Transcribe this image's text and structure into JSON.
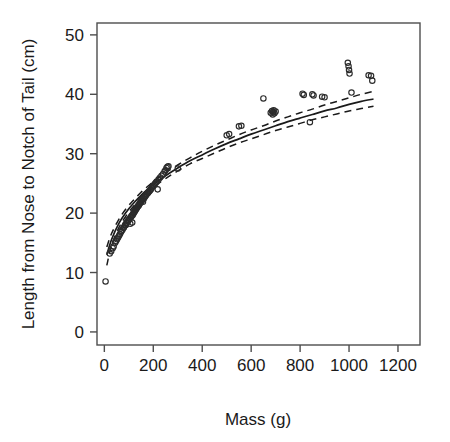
{
  "chart_data": {
    "type": "scatter",
    "title": "",
    "xlabel": "Mass (g)",
    "ylabel": "Length from Nose to Notch of Tail (cm)",
    "xlim": [
      -30,
      1290
    ],
    "ylim": [
      -2.2,
      52
    ],
    "xticks": [
      0,
      200,
      400,
      600,
      800,
      1000,
      1200
    ],
    "yticks": [
      0,
      10,
      20,
      30,
      40,
      50
    ],
    "xtick_labels": [
      "0",
      "200",
      "400",
      "600",
      "800",
      "1000",
      "1200"
    ],
    "ytick_labels": [
      "0",
      "10",
      "20",
      "30",
      "40",
      "50"
    ],
    "grid": false,
    "legend": false,
    "box_frame": true,
    "point_marker": "open-circle",
    "point_color": "#2b2b2b",
    "line_color": "#1a1a1a",
    "background_color": "#ffffff",
    "series": [
      {
        "name": "observations",
        "type": "scatter",
        "points": [
          [
            5,
            8.5
          ],
          [
            22,
            13.2
          ],
          [
            28,
            13.6
          ],
          [
            34,
            14.1
          ],
          [
            38,
            14.4
          ],
          [
            44,
            15.0
          ],
          [
            48,
            15.3
          ],
          [
            52,
            15.6
          ],
          [
            56,
            15.9
          ],
          [
            60,
            16.2
          ],
          [
            64,
            16.5
          ],
          [
            68,
            16.8
          ],
          [
            70,
            17.0
          ],
          [
            74,
            17.2
          ],
          [
            78,
            17.5
          ],
          [
            80,
            17.6
          ],
          [
            84,
            17.9
          ],
          [
            86,
            18.1
          ],
          [
            88,
            18.0
          ],
          [
            90,
            18.3
          ],
          [
            92,
            18.4
          ],
          [
            96,
            18.6
          ],
          [
            98,
            18.8
          ],
          [
            100,
            18.9
          ],
          [
            104,
            19.1
          ],
          [
            106,
            18.2
          ],
          [
            108,
            19.3
          ],
          [
            110,
            19.4
          ],
          [
            112,
            19.6
          ],
          [
            114,
            18.4
          ],
          [
            116,
            19.7
          ],
          [
            118,
            19.9
          ],
          [
            120,
            20.0
          ],
          [
            122,
            20.2
          ],
          [
            124,
            20.3
          ],
          [
            126,
            20.4
          ],
          [
            128,
            20.6
          ],
          [
            130,
            20.7
          ],
          [
            132,
            20.8
          ],
          [
            134,
            21.0
          ],
          [
            136,
            21.1
          ],
          [
            138,
            21.2
          ],
          [
            140,
            21.3
          ],
          [
            142,
            21.4
          ],
          [
            144,
            21.6
          ],
          [
            146,
            21.7
          ],
          [
            148,
            21.8
          ],
          [
            150,
            22.0
          ],
          [
            152,
            22.1
          ],
          [
            154,
            22.2
          ],
          [
            156,
            22.3
          ],
          [
            158,
            21.9
          ],
          [
            160,
            22.4
          ],
          [
            162,
            22.5
          ],
          [
            165,
            22.7
          ],
          [
            168,
            22.9
          ],
          [
            170,
            23.0
          ],
          [
            174,
            23.2
          ],
          [
            178,
            23.4
          ],
          [
            180,
            23.5
          ],
          [
            184,
            23.7
          ],
          [
            188,
            23.9
          ],
          [
            190,
            24.0
          ],
          [
            194,
            24.3
          ],
          [
            198,
            24.5
          ],
          [
            202,
            24.7
          ],
          [
            206,
            24.9
          ],
          [
            210,
            25.1
          ],
          [
            214,
            25.3
          ],
          [
            218,
            24.0
          ],
          [
            222,
            25.7
          ],
          [
            228,
            26.0
          ],
          [
            234,
            26.3
          ],
          [
            240,
            26.6
          ],
          [
            246,
            27.0
          ],
          [
            250,
            27.2
          ],
          [
            254,
            27.6
          ],
          [
            258,
            27.8
          ],
          [
            262,
            27.9
          ],
          [
            300,
            27.5
          ],
          [
            500,
            33.1
          ],
          [
            510,
            33.3
          ],
          [
            550,
            34.6
          ],
          [
            560,
            34.7
          ],
          [
            650,
            39.3
          ],
          [
            680,
            36.9
          ],
          [
            685,
            37.2
          ],
          [
            688,
            36.6
          ],
          [
            690,
            37.0
          ],
          [
            692,
            37.3
          ],
          [
            695,
            36.8
          ],
          [
            700,
            37.1
          ],
          [
            810,
            40.1
          ],
          [
            815,
            39.9
          ],
          [
            840,
            35.3
          ],
          [
            850,
            40.0
          ],
          [
            855,
            39.8
          ],
          [
            890,
            39.6
          ],
          [
            900,
            39.5
          ],
          [
            995,
            45.3
          ],
          [
            998,
            44.7
          ],
          [
            1000,
            44.1
          ],
          [
            1002,
            43.5
          ],
          [
            1010,
            40.3
          ],
          [
            1080,
            43.2
          ],
          [
            1090,
            43.1
          ],
          [
            1095,
            42.3
          ]
        ]
      },
      {
        "name": "fitted-curve",
        "type": "line",
        "style": "solid",
        "points": [
          [
            10,
            13.0
          ],
          [
            30,
            15.6
          ],
          [
            60,
            18.3
          ],
          [
            90,
            20.2
          ],
          [
            120,
            21.7
          ],
          [
            150,
            23.0
          ],
          [
            180,
            24.1
          ],
          [
            210,
            25.1
          ],
          [
            250,
            26.3
          ],
          [
            300,
            27.6
          ],
          [
            350,
            28.8
          ],
          [
            400,
            29.8
          ],
          [
            450,
            30.8
          ],
          [
            500,
            31.7
          ],
          [
            550,
            32.5
          ],
          [
            600,
            33.3
          ],
          [
            650,
            34.0
          ],
          [
            700,
            34.7
          ],
          [
            750,
            35.4
          ],
          [
            800,
            36.0
          ],
          [
            850,
            36.6
          ],
          [
            900,
            37.2
          ],
          [
            950,
            37.7
          ],
          [
            1000,
            38.3
          ],
          [
            1050,
            38.8
          ],
          [
            1100,
            39.2
          ]
        ]
      },
      {
        "name": "confidence-upper",
        "type": "line",
        "style": "dashed",
        "points": [
          [
            10,
            14.3
          ],
          [
            30,
            16.6
          ],
          [
            60,
            19.0
          ],
          [
            90,
            20.8
          ],
          [
            120,
            22.2
          ],
          [
            150,
            23.5
          ],
          [
            180,
            24.6
          ],
          [
            210,
            25.6
          ],
          [
            250,
            26.8
          ],
          [
            300,
            28.1
          ],
          [
            350,
            29.3
          ],
          [
            400,
            30.4
          ],
          [
            450,
            31.4
          ],
          [
            500,
            32.3
          ],
          [
            550,
            33.2
          ],
          [
            600,
            34.0
          ],
          [
            650,
            34.7
          ],
          [
            700,
            35.5
          ],
          [
            750,
            36.2
          ],
          [
            800,
            36.9
          ],
          [
            850,
            37.5
          ],
          [
            900,
            38.2
          ],
          [
            950,
            38.8
          ],
          [
            1000,
            39.4
          ],
          [
            1050,
            40.0
          ],
          [
            1100,
            40.5
          ]
        ]
      },
      {
        "name": "confidence-lower",
        "type": "line",
        "style": "dashed",
        "points": [
          [
            10,
            11.2
          ],
          [
            30,
            14.6
          ],
          [
            60,
            17.6
          ],
          [
            90,
            19.6
          ],
          [
            120,
            21.2
          ],
          [
            150,
            22.5
          ],
          [
            180,
            23.6
          ],
          [
            210,
            24.6
          ],
          [
            250,
            25.8
          ],
          [
            300,
            27.1
          ],
          [
            350,
            28.3
          ],
          [
            400,
            29.2
          ],
          [
            450,
            30.1
          ],
          [
            500,
            31.0
          ],
          [
            550,
            31.8
          ],
          [
            600,
            32.5
          ],
          [
            650,
            33.2
          ],
          [
            700,
            33.9
          ],
          [
            750,
            34.5
          ],
          [
            800,
            35.1
          ],
          [
            850,
            35.7
          ],
          [
            900,
            36.2
          ],
          [
            950,
            36.7
          ],
          [
            1000,
            37.2
          ],
          [
            1050,
            37.6
          ],
          [
            1100,
            38.0
          ]
        ]
      }
    ]
  },
  "axes": {
    "x_title": "Mass (g)",
    "y_title": "Length from Nose to Notch of Tail (cm)"
  }
}
